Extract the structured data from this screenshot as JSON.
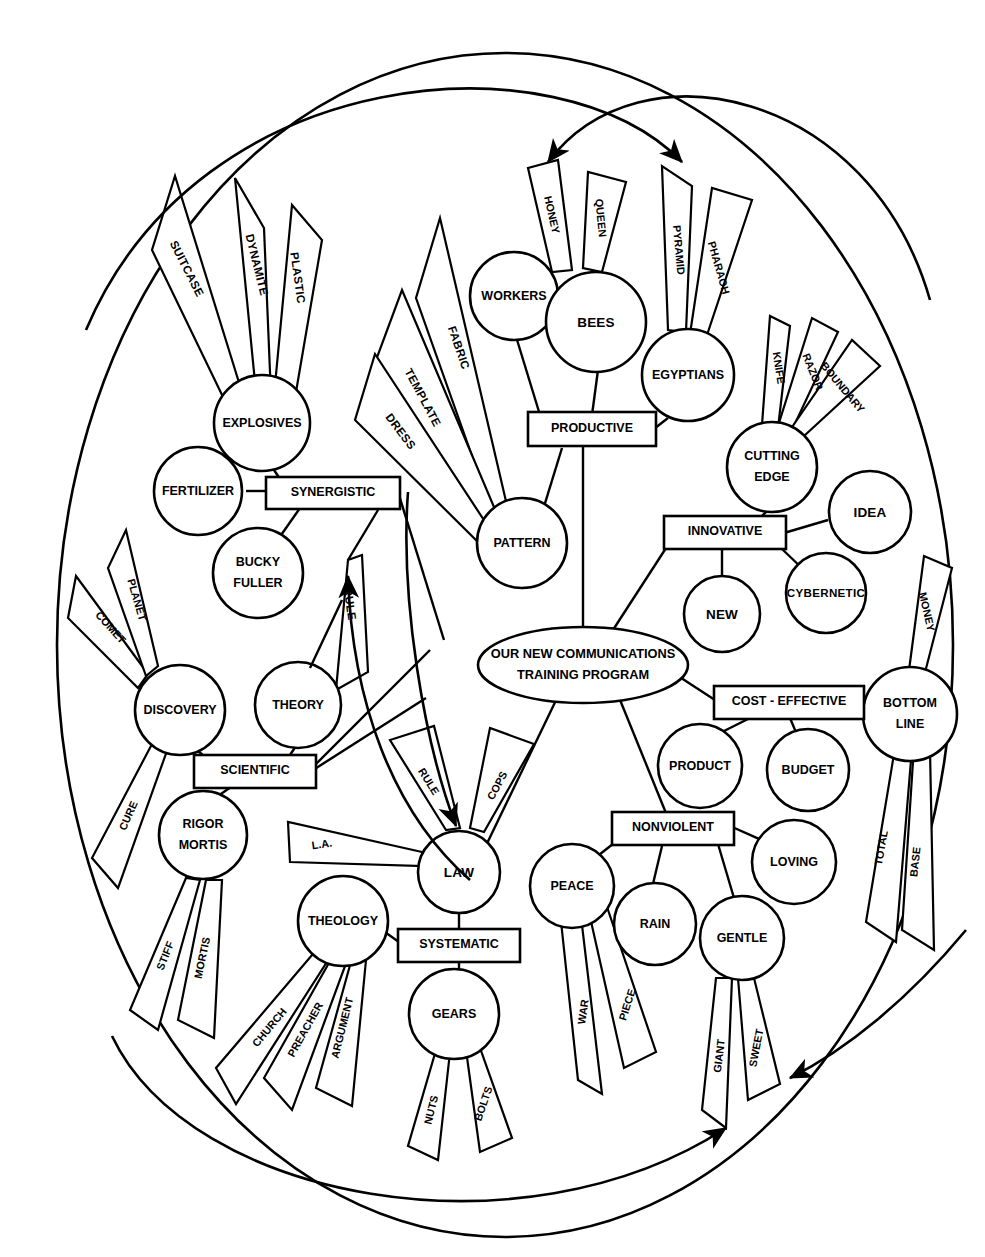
{
  "diagram": {
    "center": {
      "label": "OUR NEW COMMUNICATIONS TRAINING PROGRAM",
      "line1": "OUR NEW COMMUNICATIONS",
      "line2": "TRAINING PROGRAM"
    },
    "colors": {
      "ink": "#000000",
      "paper": "#ffffff"
    },
    "branches": [
      {
        "id": "synergistic",
        "label": "SYNERGISTIC",
        "shape": "rect",
        "nodes": [
          {
            "id": "explosives",
            "label": "EXPLOSIVES",
            "shape": "circle",
            "wedges": [
              "SUITCASE",
              "DYNAMITE",
              "PLASTIC"
            ]
          },
          {
            "id": "fertilizer",
            "label": "FERTILIZER",
            "shape": "circle",
            "wedges": []
          },
          {
            "id": "bucky-fuller",
            "label": "BUCKY FULLER",
            "line1": "BUCKY",
            "line2": "FULLER",
            "shape": "circle",
            "wedges": []
          }
        ],
        "wedges": [
          "RULE"
        ]
      },
      {
        "id": "productive",
        "label": "PRODUCTIVE",
        "shape": "rect",
        "nodes": [
          {
            "id": "workers",
            "label": "WORKERS",
            "shape": "circle",
            "wedges": []
          },
          {
            "id": "bees",
            "label": "BEES",
            "shape": "circle",
            "wedges": [
              "HONEY",
              "QUEEN"
            ]
          },
          {
            "id": "egyptians",
            "label": "EGYPTIANS",
            "shape": "circle",
            "wedges": [
              "PYRAMID",
              "PHARAOH"
            ]
          },
          {
            "id": "pattern",
            "label": "PATTERN",
            "shape": "circle",
            "wedges": [
              "FABRIC",
              "TEMPLATE",
              "DRESS"
            ]
          }
        ],
        "wedges": []
      },
      {
        "id": "innovative",
        "label": "INNOVATIVE",
        "shape": "rect",
        "nodes": [
          {
            "id": "cutting-edge",
            "label": "CUTTING EDGE",
            "line1": "CUTTING",
            "line2": "EDGE",
            "shape": "circle",
            "wedges": [
              "KNIFE",
              "RAZOR",
              "BOUNDARY"
            ]
          },
          {
            "id": "idea",
            "label": "IDEA",
            "shape": "circle",
            "wedges": []
          },
          {
            "id": "new",
            "label": "NEW",
            "shape": "circle",
            "wedges": []
          },
          {
            "id": "cybernetic",
            "label": "CYBERNETIC",
            "shape": "circle",
            "wedges": []
          }
        ],
        "wedges": []
      },
      {
        "id": "cost-effective",
        "label": "COST - EFFECTIVE",
        "shape": "rect",
        "nodes": [
          {
            "id": "product",
            "label": "PRODUCT",
            "shape": "circle",
            "wedges": []
          },
          {
            "id": "budget",
            "label": "BUDGET",
            "shape": "circle",
            "wedges": []
          },
          {
            "id": "bottom-line",
            "label": "BOTTOM LINE",
            "line1": "BOTTOM",
            "line2": "LINE",
            "shape": "circle",
            "wedges": [
              "MONEY",
              "TOTAL",
              "BASE"
            ]
          }
        ],
        "wedges": []
      },
      {
        "id": "nonviolent",
        "label": "NONVIOLENT",
        "shape": "rect",
        "nodes": [
          {
            "id": "peace",
            "label": "PEACE",
            "shape": "circle",
            "wedges": [
              "WAR",
              "PIECE"
            ]
          },
          {
            "id": "rain",
            "label": "RAIN",
            "shape": "circle",
            "wedges": []
          },
          {
            "id": "gentle",
            "label": "GENTLE",
            "shape": "circle",
            "wedges": [
              "GIANT",
              "SWEET"
            ]
          },
          {
            "id": "loving",
            "label": "LOVING",
            "shape": "circle",
            "wedges": []
          }
        ],
        "wedges": []
      },
      {
        "id": "systematic",
        "label": "SYSTEMATIC",
        "shape": "rect",
        "nodes": [
          {
            "id": "law",
            "label": "LAW",
            "shape": "circle",
            "wedges": [
              "RULE",
              "COPS",
              "L.A."
            ]
          },
          {
            "id": "theology",
            "label": "THEOLOGY",
            "shape": "circle",
            "wedges": [
              "CHURCH",
              "PREACHER",
              "ARGUMENT"
            ]
          },
          {
            "id": "gears",
            "label": "GEARS",
            "shape": "circle",
            "wedges": [
              "NUTS",
              "BOLTS"
            ]
          }
        ],
        "wedges": []
      },
      {
        "id": "scientific",
        "label": "SCIENTIFIC",
        "shape": "rect",
        "nodes": [
          {
            "id": "discovery",
            "label": "DISCOVERY",
            "shape": "circle",
            "wedges": [
              "COMET",
              "PLANET",
              "CURE"
            ]
          },
          {
            "id": "theory",
            "label": "THEORY",
            "shape": "circle",
            "wedges": []
          },
          {
            "id": "rigor-mortis",
            "label": "RIGOR MORTIS",
            "line1": "RIGOR",
            "line2": "MORTIS",
            "shape": "circle",
            "wedges": [
              "STIFF",
              "MORTIS"
            ]
          }
        ],
        "wedges": []
      }
    ],
    "annotation_arrows": [
      {
        "id": "arrow-top-left",
        "from": "upper-right-arc",
        "to": "honey-wedge"
      },
      {
        "id": "arrow-top-right",
        "from": "upper-left-arc",
        "to": "pyramid-wedge"
      },
      {
        "id": "arrow-to-rule",
        "from": "lower-left-curve",
        "to": "rule-wedge"
      },
      {
        "id": "arrow-to-law",
        "from": "upper-curve",
        "to": "law-node"
      },
      {
        "id": "arrow-to-sweet",
        "from": "right-curve",
        "to": "sweet-wedge"
      },
      {
        "id": "arrow-to-giant",
        "from": "bottom-arc",
        "to": "giant-wedge"
      }
    ]
  }
}
